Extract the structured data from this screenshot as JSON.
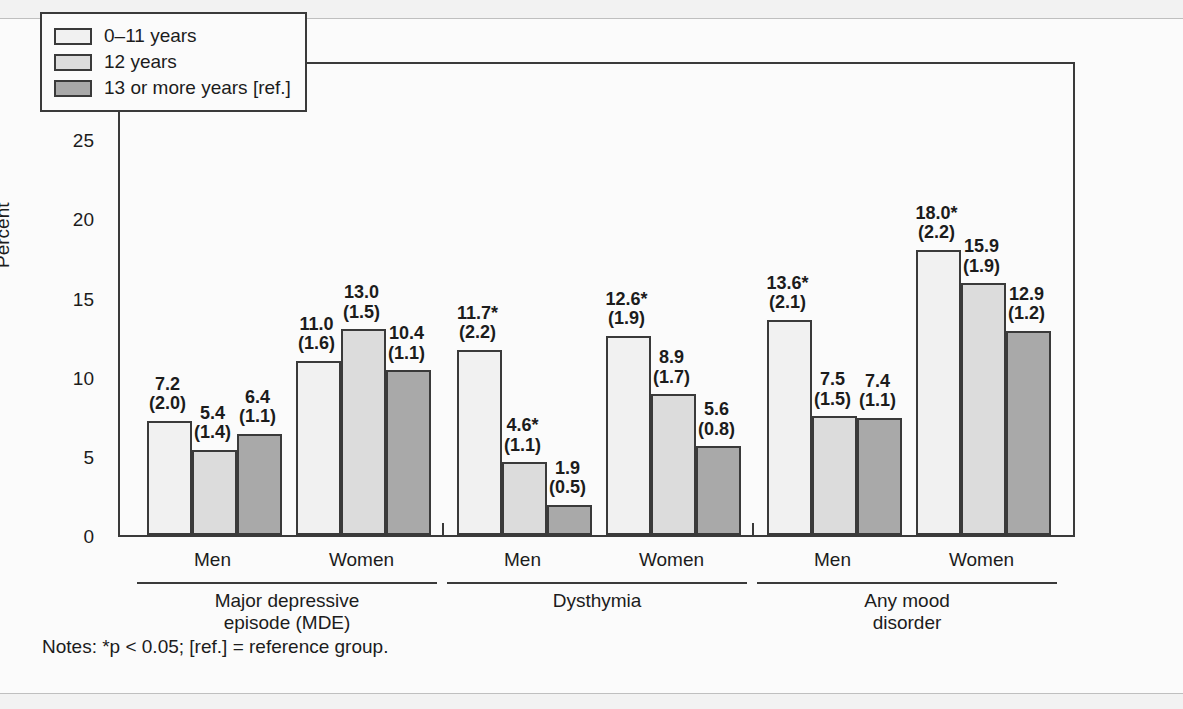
{
  "chart_data": {
    "type": "bar",
    "title": "",
    "xlabel": "",
    "ylabel": "Percent",
    "ylim": [
      0,
      30
    ],
    "yticks": [
      0,
      5,
      10,
      15,
      20,
      25,
      30
    ],
    "grid": false,
    "legend_position": "top-left",
    "legend": [
      "0–11 years",
      "12 years",
      "13 or more years [ref.]"
    ],
    "series": [
      {
        "name": "0–11 years",
        "fill": "#f1f1f1",
        "values": [
          7.2,
          11.0,
          11.7,
          12.6,
          13.6,
          18.0
        ],
        "labels": [
          "7.2",
          "11.0",
          "11.7*",
          "12.6*",
          "13.6*",
          "18.0*"
        ],
        "errors": [
          "(2.0)",
          "(1.6)",
          "(2.2)",
          "(1.9)",
          "(2.1)",
          "(2.2)"
        ]
      },
      {
        "name": "12 years",
        "fill": "#dcdcdc",
        "values": [
          5.4,
          13.0,
          4.6,
          8.9,
          7.5,
          15.9
        ],
        "labels": [
          "5.4",
          "13.0",
          "4.6*",
          "8.9",
          "7.5",
          "15.9"
        ],
        "errors": [
          "(1.4)",
          "(1.5)",
          "(1.1)",
          "(1.7)",
          "(1.5)",
          "(1.9)"
        ]
      },
      {
        "name": "13 or more years [ref.]",
        "fill": "#a9a9a9",
        "values": [
          6.4,
          10.4,
          1.9,
          5.6,
          7.4,
          12.9
        ],
        "labels": [
          "6.4",
          "10.4",
          "1.9",
          "5.6",
          "7.4",
          "12.9"
        ],
        "errors": [
          "(1.1)",
          "(1.1)",
          "(0.5)",
          "(0.8)",
          "(1.1)",
          "(1.2)"
        ]
      }
    ],
    "categories": [
      "Men",
      "Women",
      "Men",
      "Women",
      "Men",
      "Women"
    ],
    "groups": [
      {
        "label": "Major depressive\nepisode (MDE)",
        "line1": "Major depressive",
        "line2": "episode (MDE)",
        "categories": [
          "Men",
          "Women"
        ]
      },
      {
        "label": "Dysthymia",
        "line1": "Dysthymia",
        "line2": "",
        "categories": [
          "Men",
          "Women"
        ]
      },
      {
        "label": "Any mood\ndisorder",
        "line1": "Any mood",
        "line2": "disorder",
        "categories": [
          "Men",
          "Women"
        ]
      }
    ],
    "annotations": [
      "*p < 0.05",
      "[ref.] = reference group"
    ]
  },
  "notes": "Notes: *p < 0.05; [ref.] = reference group.",
  "colors": {
    "series_0": "#f1f1f1",
    "series_1": "#dcdcdc",
    "series_2": "#a9a9a9",
    "axis": "#3a3a3a",
    "text": "#1c1c1c",
    "background": "#fbfbfb"
  }
}
